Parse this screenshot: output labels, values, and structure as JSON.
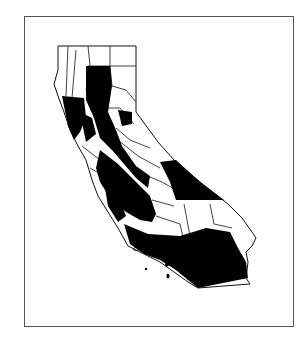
{
  "map": {
    "title": "",
    "subject": "California counties",
    "legend": [],
    "colors": {
      "highlighted": "#000000",
      "other": "#ffffff",
      "border": "#111111",
      "frame": "#555555"
    },
    "highlighted_regions": [
      "Sacramento Valley / north-central counties",
      "North Coast / Bay Area counties (partial)",
      "San Joaquin Valley",
      "Central Coast",
      "Inyo / Mono (eastern Sierra)",
      "Southern California (Los Angeles, San Bernardino, Riverside, Orange, San Diego, Ventura, Santa Barbara)"
    ]
  }
}
